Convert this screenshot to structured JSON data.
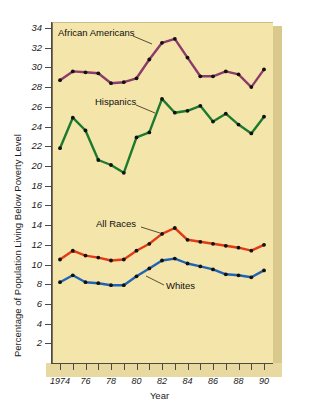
{
  "chart_data": {
    "type": "line",
    "title": "",
    "xlabel": "Year",
    "ylabel": "Percentage of Population Living Below Poverty Level",
    "xlim": [
      1974,
      1990
    ],
    "ylim": [
      0,
      34
    ],
    "ytick_step": 2,
    "yticks": [
      2,
      4,
      6,
      8,
      10,
      12,
      14,
      16,
      18,
      20,
      22,
      24,
      26,
      28,
      30,
      32,
      34
    ],
    "ytick_labels": [
      "2",
      "4",
      "6",
      "8",
      "10",
      "12",
      "14",
      "16",
      "18",
      "20",
      "22",
      "24",
      "26",
      "28",
      "30",
      "32",
      "34"
    ],
    "x": [
      1974,
      1975,
      1976,
      1977,
      1978,
      1979,
      1980,
      1981,
      1982,
      1983,
      1984,
      1985,
      1986,
      1987,
      1988,
      1989,
      1990
    ],
    "xticks": [
      1974,
      1975,
      1976,
      1977,
      1978,
      1979,
      1980,
      1981,
      1982,
      1983,
      1984,
      1985,
      1986,
      1987,
      1988,
      1989,
      1990
    ],
    "xtick_labels": [
      "1974",
      "",
      "76",
      "",
      "78",
      "",
      "80",
      "",
      "82",
      "",
      "84",
      "",
      "86",
      "",
      "88",
      "",
      "90"
    ],
    "grid": false,
    "legend_position": "inline-annotations",
    "markers": "filled-circle-black",
    "background_color": "#f4e5ab",
    "series": [
      {
        "name": "African Americans",
        "color": "#8e3a6b",
        "label_text": "African Americans",
        "values": [
          28.7,
          29.6,
          29.5,
          29.4,
          28.4,
          28.5,
          28.9,
          30.8,
          32.5,
          32.9,
          31.0,
          29.1,
          29.1,
          29.6,
          29.3,
          28.0,
          29.8
        ]
      },
      {
        "name": "Hispanics",
        "color": "#1c7a2e",
        "label_text": "Hispanics",
        "values": [
          21.8,
          24.9,
          23.6,
          20.6,
          20.1,
          19.3,
          22.9,
          23.4,
          26.8,
          25.4,
          25.6,
          26.1,
          24.5,
          25.3,
          24.2,
          23.3,
          25.0
        ]
      },
      {
        "name": "All Races",
        "color": "#e03a16",
        "label_text": "All Races",
        "values": [
          10.5,
          11.4,
          10.9,
          10.7,
          10.4,
          10.5,
          11.4,
          12.1,
          13.1,
          13.7,
          12.5,
          12.3,
          12.1,
          11.9,
          11.7,
          11.4,
          12.0
        ]
      },
      {
        "name": "Whites",
        "color": "#1f63b5",
        "label_text": "Whites",
        "values": [
          8.2,
          8.9,
          8.2,
          8.1,
          7.9,
          7.9,
          8.8,
          9.6,
          10.4,
          10.6,
          10.1,
          9.8,
          9.5,
          9.0,
          8.9,
          8.7,
          9.4
        ]
      }
    ]
  },
  "axes": {
    "x_title": "Year",
    "y_title": "Percentage of Population Living Below Poverty Level"
  },
  "annotations": {
    "african_americans": "African Americans",
    "hispanics": "Hispanics",
    "all_races": "All Races",
    "whites": "Whites"
  },
  "colors": {
    "plot_background": "#f4e5ab",
    "slab_side": "#d9c98d",
    "slab_bottom": "#e8d9a0",
    "african_americans": "#8e3a6b",
    "hispanics": "#1c7a2e",
    "all_races": "#e03a16",
    "whites": "#1f63b5",
    "marker": "#111111",
    "axis": "#4a4a44"
  }
}
